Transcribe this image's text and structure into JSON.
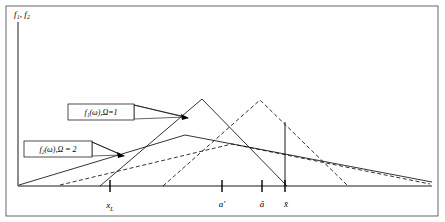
{
  "figure": {
    "name": "fuzzy-membership-functions-plot",
    "axes": {
      "y_label": "f₁, f₂",
      "x_label": "",
      "x_ticks": [
        {
          "id": "x-sub-L",
          "label": "x",
          "sub": "L",
          "accent": "none",
          "x": 110
        },
        {
          "id": "a-prime",
          "label": "a",
          "sub": "",
          "accent": "prime",
          "x": 222
        },
        {
          "id": "a-hat",
          "label": "a",
          "sub": "",
          "accent": "hat",
          "x": 262
        },
        {
          "id": "x-bar",
          "label": "x",
          "sub": "",
          "accent": "bar",
          "x": 285
        }
      ]
    },
    "callouts": [
      {
        "id": "callout-f1",
        "text": "f₁(ω),Ω=1",
        "box": {
          "x": 68,
          "y": 104,
          "w": 66,
          "h": 16
        },
        "leader_to": {
          "x": 186,
          "y": 117
        }
      },
      {
        "id": "callout-f2",
        "text": "f₂(ω),Ω = 2",
        "box": {
          "x": 24,
          "y": 141,
          "w": 68,
          "h": 16
        },
        "leader_to": {
          "x": 120,
          "y": 156
        }
      }
    ],
    "colors": {
      "line": "#000000",
      "background": "#ffffff",
      "frame": "#000000"
    },
    "curves": [
      {
        "id": "f1-solid-triangle-left",
        "style": "solid",
        "note": "narrow triangular membership, apex near a'"
      },
      {
        "id": "f1-dashed-triangle-right",
        "style": "dashed",
        "note": "narrow triangular membership, apex near a-hat"
      },
      {
        "id": "f2-solid-broad",
        "style": "solid",
        "note": "broad flat membership, Omega=2"
      },
      {
        "id": "f2-dashed-broad",
        "style": "dashed",
        "note": "broad flat membership shifted right, Omega=2"
      }
    ],
    "vertical_line": {
      "id": "x-bar-vertical",
      "x": 285,
      "y_top": 122,
      "y_bottom": 186
    }
  }
}
